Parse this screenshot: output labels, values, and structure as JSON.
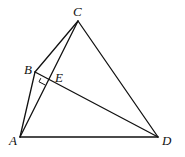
{
  "diagram": {
    "type": "geometry",
    "points": {
      "A": {
        "label": "A",
        "x": 20,
        "y": 137
      },
      "B": {
        "label": "B",
        "x": 35,
        "y": 72
      },
      "C": {
        "label": "C",
        "x": 78,
        "y": 21
      },
      "D": {
        "label": "D",
        "x": 158,
        "y": 137
      },
      "E": {
        "label": "E",
        "x": 47,
        "y": 81
      }
    },
    "segments": [
      "AB",
      "BC",
      "CD",
      "DA",
      "AC",
      "BD"
    ],
    "right_angle_at": "E",
    "labels": {
      "A": "A",
      "B": "B",
      "C": "C",
      "D": "D",
      "E": "E"
    }
  }
}
